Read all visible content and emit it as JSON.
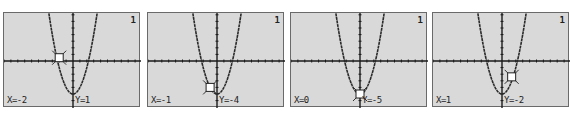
{
  "screens": [
    {
      "plot_number": "1",
      "x_label": "X=-2",
      "y_label": "Y=1",
      "cursor": {
        "x": -2,
        "y": 0.5
      }
    },
    {
      "plot_number": "1",
      "x_label": "X=-1",
      "y_label": "Y=-4",
      "cursor": {
        "x": -1,
        "y": -4
      }
    },
    {
      "plot_number": "1",
      "x_label": "X=0",
      "y_label": "Y=-5",
      "cursor": {
        "x": 0,
        "y": -5
      }
    },
    {
      "plot_number": "1",
      "x_label": "X=1",
      "y_label": "Y=-2",
      "cursor": {
        "x": 1.4,
        "y": -2.4
      }
    }
  ],
  "graph": {
    "function": "y = x^2 - 5",
    "xmin": -10,
    "xmax": 10,
    "ymin": -6,
    "ymax": 8,
    "background_color": "#d9d9d9",
    "curve_color": "#2a2a2a",
    "axis_color": "#1a1a1a"
  },
  "chart_data": {
    "type": "line",
    "title": "",
    "xlabel": "X",
    "ylabel": "Y",
    "trace_points": [
      {
        "x": -2,
        "y": 1
      },
      {
        "x": -1,
        "y": -4
      },
      {
        "x": 0,
        "y": -5
      },
      {
        "x": 1,
        "y": -2
      }
    ],
    "xlim": [
      -10,
      10
    ],
    "ylim": [
      -6,
      8
    ]
  }
}
